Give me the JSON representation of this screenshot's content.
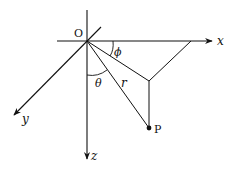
{
  "diagram": {
    "labels": {
      "origin": "O",
      "x_axis": "x",
      "y_axis": "y",
      "z_axis": "z",
      "point": "P",
      "radius": "r",
      "theta": "θ",
      "phi": "ϕ"
    },
    "colors": {
      "stroke": "#111111",
      "background": "#ffffff"
    }
  }
}
